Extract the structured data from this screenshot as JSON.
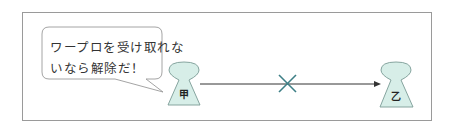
{
  "diagram": {
    "speech_bubble": {
      "lines": [
        "ワープロを受け取れな",
        "いなら解除だ！"
      ]
    },
    "party_a": {
      "label": "甲",
      "fill": "#d7eee8"
    },
    "party_b": {
      "label": "乙",
      "fill": "#d7eee8"
    },
    "connection": {
      "type": "arrow",
      "status_mark": "cross",
      "mark_color": "#3d7f86"
    },
    "colors": {
      "frame": "#9a9a9a",
      "arrow": "#333333",
      "figure_stroke": "#7a9b95"
    }
  }
}
